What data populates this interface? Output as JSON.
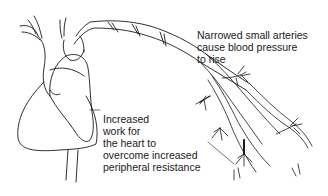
{
  "diagram": {
    "labels": {
      "arteries": {
        "lines": [
          "Narrowed small arteries",
          "cause blood pressure",
          "to rise"
        ]
      },
      "heart": {
        "lines": [
          "Increased",
          "work for",
          "the heart to",
          "overcome increased",
          "peripheral resistance"
        ]
      }
    },
    "colors": {
      "line": "#1a1a1a",
      "background": "#ffffff"
    }
  }
}
